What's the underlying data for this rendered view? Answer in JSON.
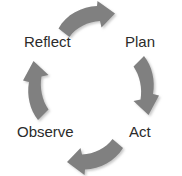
{
  "diagram": {
    "type": "cycle",
    "title": "",
    "direction": "clockwise",
    "arrow_color": "#808080",
    "arrow_shadow_color": "#b0b0b0",
    "label_color": "#2b2b2b",
    "background_color": "#ffffff",
    "stages": [
      {
        "id": "plan",
        "label": "Plan",
        "position": "top-right"
      },
      {
        "id": "act",
        "label": "Act",
        "position": "bottom-right"
      },
      {
        "id": "observe",
        "label": "Observe",
        "position": "bottom-left"
      },
      {
        "id": "reflect",
        "label": "Reflect",
        "position": "top-left"
      }
    ],
    "arrows": [
      {
        "id": "top",
        "from": "reflect",
        "to": "plan",
        "points": "right"
      },
      {
        "id": "right",
        "from": "plan",
        "to": "act",
        "points": "down"
      },
      {
        "id": "bottom",
        "from": "act",
        "to": "observe",
        "points": "left"
      },
      {
        "id": "left",
        "from": "observe",
        "to": "reflect",
        "points": "up"
      }
    ]
  }
}
